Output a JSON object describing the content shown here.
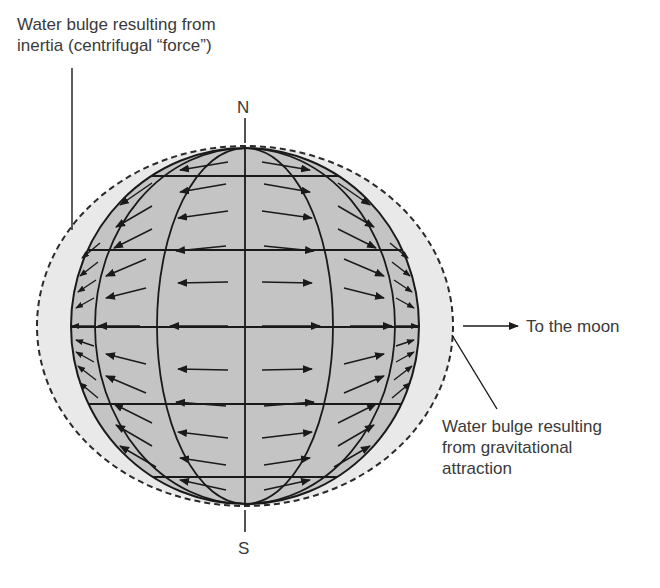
{
  "labels": {
    "inertia_bulge_line1": "Water bulge resulting from",
    "inertia_bulge_line2": "inertia (centrifugal “force”)",
    "gravity_bulge_line1": "Water bulge resulting",
    "gravity_bulge_line2": "from gravitational",
    "gravity_bulge_line3": "attraction",
    "to_moon": "To the moon",
    "north": "N",
    "south": "S"
  },
  "colors": {
    "globe_fill": "#c4c4c4",
    "bulge_fill": "#e9e9e9",
    "line": "#1a1a1a",
    "text": "#3a3a3a"
  },
  "diagram": {
    "globe": {
      "cx": 245,
      "cy": 326,
      "rx": 174,
      "ry": 178
    },
    "bulge": {
      "cx": 245,
      "cy": 326,
      "rx": 208,
      "ry": 180
    },
    "latitudes_y": [
      176,
      250,
      327,
      404,
      477
    ],
    "arrows_point": "away from the central N-S axis (left half leftward, right half rightward)"
  }
}
